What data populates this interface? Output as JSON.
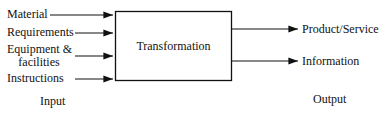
{
  "diagram": {
    "inputs": [
      {
        "label": "Material"
      },
      {
        "label": "Requirements"
      },
      {
        "label_line1": "Equipment &",
        "label_line2": "facilities"
      },
      {
        "label": "Instructions"
      }
    ],
    "process": {
      "label": "Transformation"
    },
    "outputs": [
      {
        "label": "Product/Service"
      },
      {
        "label": "Information"
      }
    ],
    "input_caption": "Input",
    "output_caption": "Output"
  }
}
